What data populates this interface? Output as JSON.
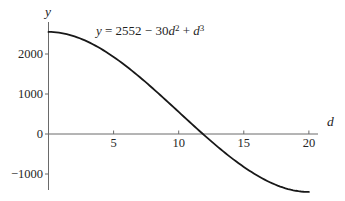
{
  "chart_data": {
    "type": "line",
    "title": "",
    "equation_text": "y = 2552 − 30d² + d³",
    "equation_segments": [
      {
        "text": "y",
        "italic": true
      },
      {
        "text": " = 2552 − 30"
      },
      {
        "text": "d",
        "italic": true
      },
      {
        "text": "2",
        "sup": true
      },
      {
        "text": " + "
      },
      {
        "text": "d",
        "italic": true
      },
      {
        "text": "3",
        "sup": true
      }
    ],
    "xlabel": "d",
    "ylabel": "y",
    "xlim": [
      0,
      20.7
    ],
    "ylim": [
      -1400,
      2800
    ],
    "grid": false,
    "legend": "none",
    "x_ticks": [
      {
        "value": 5,
        "label": "5"
      },
      {
        "value": 10,
        "label": "10"
      },
      {
        "value": 15,
        "label": "15"
      },
      {
        "value": 20,
        "label": "20"
      }
    ],
    "y_ticks": [
      {
        "value": 2000,
        "label": "2000"
      },
      {
        "value": 1000,
        "label": "1000"
      },
      {
        "value": 0,
        "label": "0"
      },
      {
        "value": -1000,
        "label": "−1000"
      }
    ],
    "function": {
      "coefficients": {
        "constant": 2552,
        "d2": -30,
        "d3": 1
      },
      "domain": [
        0,
        20
      ]
    },
    "points": [
      {
        "d": 0,
        "y": 2552
      },
      {
        "d": 2,
        "y": 2440
      },
      {
        "d": 4,
        "y": 2136
      },
      {
        "d": 6,
        "y": 1688
      },
      {
        "d": 8,
        "y": 1144
      },
      {
        "d": 10,
        "y": 552
      },
      {
        "d": 12,
        "y": -40
      },
      {
        "d": 14,
        "y": -584
      },
      {
        "d": 16,
        "y": -1032
      },
      {
        "d": 18,
        "y": -1336
      },
      {
        "d": 20,
        "y": -1448
      }
    ],
    "curve_color": "#181818",
    "axis_color": "#6a6a6a",
    "text_color": "#262626",
    "background_color": "#ffffff"
  }
}
